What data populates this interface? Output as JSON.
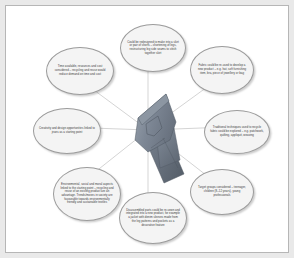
{
  "diagram": {
    "center": {
      "image_name": "folded-denim-jeans-photo",
      "description": "Photograph of a folded pair of denim jeans"
    },
    "colors": {
      "page_background": "#e9e9e9",
      "frame_background": "#ffffff",
      "frame_border": "#b6b6b6",
      "bubble_fill": "#f4f4f4",
      "bubble_border": "#9b9b9b",
      "connector_line": "#a8a8a8",
      "text": "#3a3a3a",
      "denim_light": "#8d96a3",
      "denim_mid": "#6f7a88",
      "denim_dark": "#5b6personal"
    },
    "bubbles": [
      {
        "id": "redesign",
        "position": "top",
        "text": "Could be redesigned to make into a skirt or pair of shorts – shortening of legs, restructuring leg side seams to stitch together skirt"
      },
      {
        "id": "fabric-reuse",
        "position": "top-right",
        "text": "Fabric could be re-used to develop a new product – e.g. hat, soft furnishing item, bra, piece of jewellery or bag"
      },
      {
        "id": "traditional-techniques",
        "position": "right",
        "text": "Traditional techniques used to recycle fabric could be explored – e.g. patchwork, quilting, appliqué, weaving"
      },
      {
        "id": "target-groups",
        "position": "bottom-right",
        "text": "Target groups considered – teenager, children (8–12 years), young professionals"
      },
      {
        "id": "disassembled-parts",
        "position": "bottom",
        "text": "Disassembled parts could be re-sewn and integrated into a new product, for example a jacket with denim sleeves made from the leg patterns and pockets as a decorative feature"
      },
      {
        "id": "environmental",
        "position": "bottom-left",
        "text": "Environmental, social and moral aspects linked to the starting point – recycling and reuse of an existing product are an advantage. Trends/moves in society are favourable towards environmentally friendly and sustainable textiles"
      },
      {
        "id": "creativity",
        "position": "left",
        "text": "Creativity and design opportunities linked to jeans as a starting point"
      },
      {
        "id": "time-cost",
        "position": "top-left",
        "text": "Time available, resources and cost considered – recycling and reuse would reduce demand on time and cost"
      }
    ]
  }
}
